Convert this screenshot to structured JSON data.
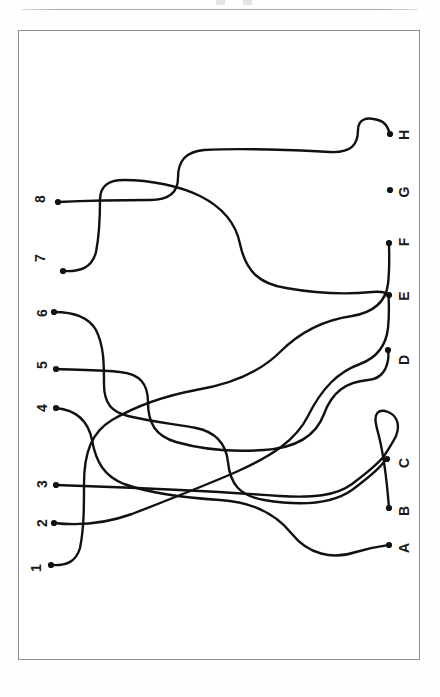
{
  "page": {
    "kind": "scanned-puzzle-page",
    "orientation": "landscape-content-on-portrait-page",
    "background_color": "#ffffff",
    "ink_color": "#111111",
    "frame_color": "#8f9094"
  },
  "puzzle": {
    "title": "",
    "type": "tangled-lines-matching",
    "left_labels": [
      "1",
      "2",
      "3",
      "4",
      "5",
      "6",
      "7",
      "8"
    ],
    "right_labels": [
      "A",
      "B",
      "C",
      "D",
      "E",
      "F",
      "G",
      "H"
    ],
    "left_endpoints": [
      {
        "label": "8",
        "label_x": 40,
        "label_y": 199,
        "dot_x": 58,
        "dot_y": 202
      },
      {
        "label": "7",
        "label_x": 40,
        "label_y": 258,
        "dot_x": 63,
        "dot_y": 271
      },
      {
        "label": "6",
        "label_x": 42,
        "label_y": 313,
        "dot_x": 54,
        "dot_y": 312
      },
      {
        "label": "5",
        "label_x": 42,
        "label_y": 365,
        "dot_x": 56,
        "dot_y": 369
      },
      {
        "label": "4",
        "label_x": 42,
        "label_y": 408,
        "dot_x": 56,
        "dot_y": 408
      },
      {
        "label": "3",
        "label_x": 42,
        "label_y": 484,
        "dot_x": 56,
        "dot_y": 485
      },
      {
        "label": "2",
        "label_x": 42,
        "label_y": 523,
        "dot_x": 54,
        "dot_y": 523
      },
      {
        "label": "1",
        "label_x": 36,
        "label_y": 568,
        "dot_x": 51,
        "dot_y": 565
      }
    ],
    "right_endpoints": [
      {
        "label": "H",
        "label_x": 404,
        "label_y": 135,
        "dot_x": 390,
        "dot_y": 134
      },
      {
        "label": "G",
        "label_x": 404,
        "label_y": 192,
        "dot_x": 390,
        "dot_y": 190
      },
      {
        "label": "F",
        "label_x": 404,
        "label_y": 242,
        "dot_x": 389,
        "dot_y": 243
      },
      {
        "label": "E",
        "label_x": 404,
        "label_y": 296,
        "dot_x": 389,
        "dot_y": 295
      },
      {
        "label": "D",
        "label_x": 404,
        "label_y": 360,
        "dot_x": 388,
        "dot_y": 350
      },
      {
        "label": "C",
        "label_x": 404,
        "label_y": 463,
        "dot_x": 387,
        "dot_y": 459
      },
      {
        "label": "B",
        "label_x": 404,
        "label_y": 511,
        "dot_x": 389,
        "dot_y": 508
      },
      {
        "label": "A",
        "label_x": 404,
        "label_y": 548,
        "dot_x": 389,
        "dot_y": 545
      }
    ],
    "frame": {
      "x": 18,
      "y": 30,
      "width": 402,
      "height": 630
    },
    "line_count": 8,
    "stroke_width": 2.4
  },
  "paths": [
    "M 58 202 C 100 200 120 200 150 200 C 170 200 178 192 178 178 C 178 160 186 152 204 150 C 240 148 300 150 330 152 C 352 153 358 144 358 130 C 358 120 366 116 378 120 C 386 122 388 128 390 134",
    "M 63 271 C 80 272 92 268 96 252 C 100 232 100 214 100 200 C 100 186 108 180 124 180 C 150 180 180 186 200 196 C 224 208 236 224 240 244 C 246 272 260 284 286 288 C 320 294 352 294 372 292 C 382 291 386 292 389 295",
    "M 54 312 C 72 312 88 316 96 330 C 104 346 104 364 104 384 C 104 404 112 412 128 416 C 152 422 176 424 196 428 C 216 432 226 444 228 462 C 230 484 240 496 264 500 C 300 506 332 504 352 490 C 368 478 378 470 384 462 C 386 460 386 459 387 459",
    "M 56 369 C 80 370 104 370 120 372 C 140 374 148 384 148 402 C 148 424 156 436 176 442 C 204 450 236 452 264 450 C 296 448 316 436 324 414 C 332 392 346 382 368 380 C 380 379 386 372 388 360 C 389 354 388 352 388 350",
    "M 56 408 C 76 410 88 420 92 440 C 96 462 104 476 124 484 C 152 494 188 498 220 500 C 252 502 276 514 292 534 C 308 554 332 560 356 552 C 372 547 382 546 389 545",
    "M 56 485 C 90 486 140 488 180 490 C 220 492 252 494 280 496 C 312 498 336 496 352 484 C 368 472 378 464 384 456 C 388 450 392 444 396 436 C 400 426 398 416 388 412 C 378 408 374 414 376 424 C 378 436 384 444 389 508",
    "M 54 523 C 80 526 104 524 132 514 C 168 500 204 486 236 472 C 272 456 296 440 308 416 C 322 388 338 372 360 364 C 376 358 386 346 388 328 C 390 308 388 300 389 295",
    "M 51 565 C 66 566 76 562 80 548 C 84 528 84 508 84 484 C 84 452 92 432 112 420 C 136 406 164 396 196 390 C 232 384 260 372 280 352 C 300 332 324 320 352 316 C 376 312 386 300 388 284 C 390 266 389 250 389 243"
  ]
}
